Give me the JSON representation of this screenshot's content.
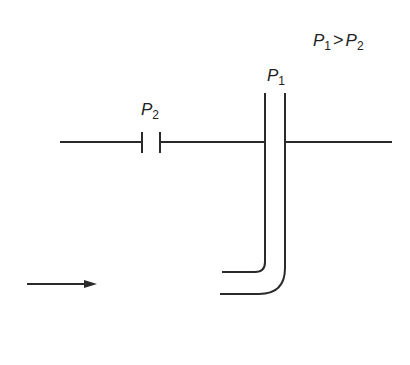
{
  "diagram": {
    "relation_label": {
      "left_sym": "P",
      "left_sub": "1",
      "op": ">",
      "right_sym": "P",
      "right_sub": "2"
    },
    "labels": {
      "p2": {
        "sym": "P",
        "sub": "2"
      },
      "p1": {
        "sym": "P",
        "sub": "1"
      }
    },
    "colors": {
      "stroke": "#2a2a2a",
      "background": "#ffffff"
    },
    "elements": [
      "horizontal-streamline",
      "constriction-plates-p2",
      "pitot-tube-p1",
      "flow-direction-arrow"
    ]
  }
}
